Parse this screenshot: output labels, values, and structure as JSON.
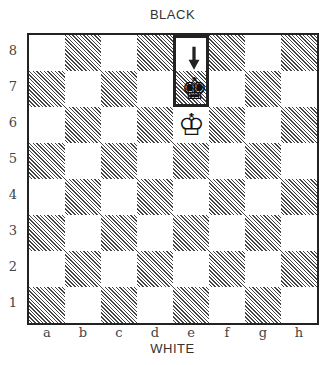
{
  "labels": {
    "top": "BLACK",
    "bottom": "WHITE"
  },
  "ranks": [
    "8",
    "7",
    "6",
    "5",
    "4",
    "3",
    "2",
    "1"
  ],
  "files": [
    "a",
    "b",
    "c",
    "d",
    "e",
    "f",
    "g",
    "h"
  ],
  "pieces": [
    {
      "square": "e7",
      "type": "king",
      "color": "black",
      "glyph": "♚"
    },
    {
      "square": "e6",
      "type": "king",
      "color": "white",
      "glyph": "♔"
    }
  ],
  "highlight": {
    "from": "e8",
    "to": "e7",
    "arrow": "down-arrow"
  },
  "colors": {
    "dark_hatch": "#444444",
    "light": "#ffffff",
    "border": "#222222"
  }
}
